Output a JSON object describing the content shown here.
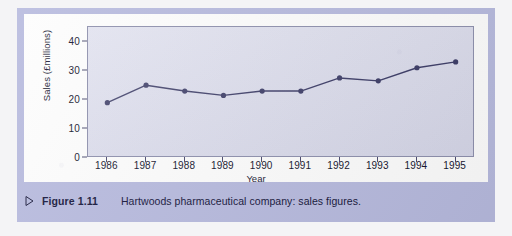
{
  "figure": {
    "caption_label": "Figure 1.11",
    "caption_text": "Hartwoods pharmaceutical company: sales figures.",
    "bullet_icon": "triangle-right-icon",
    "panel_color": "#b7bade",
    "plot_background": "#dcdded",
    "series_color": "#262655"
  },
  "chart_data": {
    "type": "line",
    "title": "",
    "xlabel": "Year",
    "ylabel": "Sales (£millions)",
    "categories": [
      "1986",
      "1987",
      "1988",
      "1989",
      "1990",
      "1991",
      "1992",
      "1993",
      "1994",
      "1995"
    ],
    "values": [
      19,
      25,
      23,
      21.5,
      23,
      23,
      27.5,
      26.5,
      31,
      33
    ],
    "series": [
      {
        "name": "Sales",
        "values": [
          19,
          25,
          23,
          21.5,
          23,
          23,
          27.5,
          26.5,
          31,
          33
        ]
      }
    ],
    "ylim": [
      0,
      45
    ],
    "ytick_labels": [
      "0",
      "10",
      "20",
      "30",
      "40"
    ],
    "ytick_values": [
      0,
      10,
      20,
      30,
      40
    ],
    "xtick_labels": [
      "1986",
      "1987",
      "1988",
      "1989",
      "1990",
      "1991",
      "1992",
      "1993",
      "1994",
      "1995"
    ],
    "grid": false,
    "legend": "none",
    "marker": "filled-circle",
    "line_color": "#262655",
    "marker_color": "#262655"
  }
}
